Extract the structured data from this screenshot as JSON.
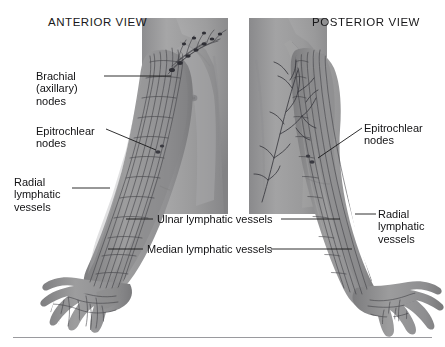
{
  "figure": {
    "kind": "anatomical-illustration",
    "background_color": "#ffffff",
    "skin_color": "#9c9c9c",
    "vessel_color": "#3d3d42",
    "text_color": "#121214",
    "rule_color": "#9a9a9e"
  },
  "titles": {
    "anterior": "ANTERIOR VIEW",
    "posterior": "POSTERIOR VIEW"
  },
  "labels": {
    "brachial": {
      "line1": "Brachial",
      "line2": "(axillary)",
      "line3": "nodes"
    },
    "epitrochlear_left": {
      "line1": "Epitrochlear",
      "line2": "nodes"
    },
    "radial_left": {
      "line1": "Radial",
      "line2": "lymphatic",
      "line3": "vessels"
    },
    "epitrochlear_right": {
      "line1": "Epitrochlear",
      "line2": "nodes"
    },
    "radial_right": {
      "line1": "Radial",
      "line2": "lymphatic",
      "line3": "vessels"
    },
    "ulnar": "Ulnar lymphatic vessels",
    "median": "Median lymphatic vessels"
  },
  "leaders": [
    {
      "name": "brachial-leader",
      "from": [
        104,
        76
      ],
      "to": [
        171,
        76
      ]
    },
    {
      "name": "epitrochlear-left-leader",
      "from": [
        106,
        129
      ],
      "to": [
        156,
        150
      ]
    },
    {
      "name": "radial-left-leader",
      "from": [
        72,
        188
      ],
      "to": [
        110,
        188
      ]
    },
    {
      "name": "epitrochlear-right-leader",
      "from": [
        362,
        128
      ],
      "to": [
        318,
        158
      ]
    },
    {
      "name": "radial-right-leader",
      "from": [
        376,
        214
      ],
      "to": [
        355,
        214
      ]
    },
    {
      "name": "ulnar-leader-left",
      "from": [
        126,
        219
      ],
      "to": [
        153,
        219
      ]
    },
    {
      "name": "ulnar-leader-right",
      "from": [
        281,
        219
      ],
      "to": [
        340,
        219
      ]
    },
    {
      "name": "median-leader-left",
      "from": [
        108,
        249
      ],
      "to": [
        143,
        249
      ]
    },
    {
      "name": "median-leader-right",
      "from": [
        271,
        249
      ],
      "to": [
        352,
        249
      ]
    }
  ]
}
